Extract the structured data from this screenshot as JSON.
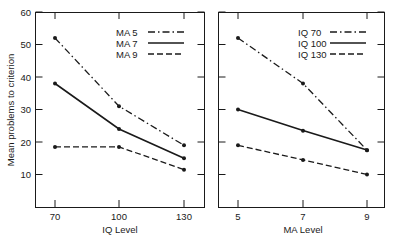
{
  "chart_data": [
    {
      "type": "line",
      "title": "",
      "xlabel": "IQ Level",
      "ylabel": "Mean problems to criterion",
      "x": [
        70,
        100,
        130
      ],
      "ylim": [
        0,
        60
      ],
      "yticks": [
        10,
        20,
        30,
        40,
        50,
        60
      ],
      "legend_position": "upper right",
      "series": [
        {
          "name": "MA 5",
          "style": "dash-dot",
          "values": [
            52,
            31,
            19
          ]
        },
        {
          "name": "MA 7",
          "style": "solid",
          "values": [
            38,
            24,
            15
          ]
        },
        {
          "name": "MA 9",
          "style": "dashed",
          "values": [
            18.5,
            18.5,
            11.5
          ]
        }
      ]
    },
    {
      "type": "line",
      "title": "",
      "xlabel": "MA Level",
      "ylabel": "",
      "x": [
        5,
        7,
        9
      ],
      "ylim": [
        0,
        60
      ],
      "yticks": [
        10,
        20,
        30,
        40,
        50,
        60
      ],
      "legend_position": "upper right",
      "series": [
        {
          "name": "IQ 70",
          "style": "dash-dot",
          "values": [
            52,
            38,
            17.5
          ]
        },
        {
          "name": "IQ 100",
          "style": "solid",
          "values": [
            30,
            23.5,
            17.5
          ]
        },
        {
          "name": "IQ 130",
          "style": "dashed",
          "values": [
            19,
            14.5,
            10
          ]
        }
      ]
    }
  ],
  "labels": {
    "ylabel": "Mean problems to criterion",
    "left_xlabel": "IQ Level",
    "right_xlabel": "MA Level",
    "left_xticks": [
      "70",
      "100",
      "130"
    ],
    "right_xticks": [
      "5",
      "7",
      "9"
    ],
    "yticks": [
      "10",
      "20",
      "30",
      "40",
      "50",
      "60"
    ],
    "left_legend": [
      "MA 5",
      "MA 7",
      "MA 9"
    ],
    "right_legend": [
      "IQ 70",
      "IQ 100",
      "IQ 130"
    ]
  },
  "colors": {
    "ink": "#1a1a1a",
    "background": "#ffffff"
  }
}
